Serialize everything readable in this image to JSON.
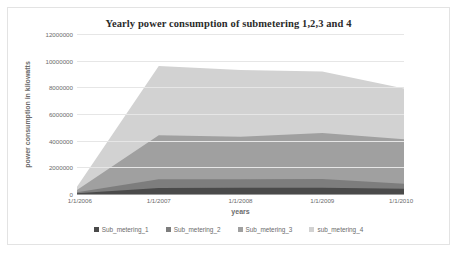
{
  "chart_data": {
    "type": "area",
    "stacked": true,
    "title": "Yearly power consumption of submetering 1,2,3 and 4",
    "xlabel": "years",
    "ylabel": "power consumption in kilowatts",
    "grid": true,
    "legend_position": "bottom",
    "x": [
      "1/1/2006",
      "1/1/2007",
      "1/1/2008",
      "1/1/2009",
      "1/1/2010"
    ],
    "xtick_labels": [
      "1/1/2006",
      "1/1/2007",
      "1/1/2008",
      "1/1/2009",
      "1/1/2010"
    ],
    "ytick_labels": [
      "0",
      "2000000",
      "4000000",
      "6000000",
      "8000000",
      "10000000",
      "12000000"
    ],
    "ytick_values": [
      0,
      2000000,
      4000000,
      6000000,
      8000000,
      10000000,
      12000000
    ],
    "ylim": [
      0,
      12000000
    ],
    "series": [
      {
        "name": "Sub_metering_1",
        "color": "#4a4a4a",
        "values": [
          60000,
          450000,
          460000,
          470000,
          400000
        ]
      },
      {
        "name": "Sub_metering_2",
        "color": "#7d7d7d",
        "values": [
          70000,
          650000,
          640000,
          660000,
          360000
        ]
      },
      {
        "name": "Sub_metering_3",
        "color": "#a0a0a0",
        "values": [
          170000,
          3300000,
          3200000,
          3450000,
          3350000
        ]
      },
      {
        "name": "sub_metering_4",
        "color": "#d2d2d2",
        "values": [
          250000,
          5200000,
          5000000,
          4600000,
          3800000
        ]
      }
    ]
  },
  "legend": {
    "items": [
      {
        "label": "Sub_metering_1",
        "color": "#4a4a4a"
      },
      {
        "label": "Sub_metering_2",
        "color": "#7d7d7d"
      },
      {
        "label": "Sub_metering_3",
        "color": "#a0a0a0"
      },
      {
        "label": "sub_metering_4",
        "color": "#d2d2d2"
      }
    ]
  },
  "colors": {
    "gridline": "#e6e6e6",
    "axis": "#9a9a9a",
    "text": "#6b6b6b",
    "title": "#2b2b2b",
    "frame_border": "#e3e3e3",
    "background": "#ffffff"
  }
}
